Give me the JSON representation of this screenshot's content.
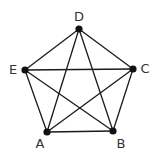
{
  "diagram": {
    "type": "complete-graph",
    "nodes": [
      {
        "id": "D",
        "label": "D",
        "x": 79,
        "y": 29,
        "lx": 79,
        "ly": 21
      },
      {
        "id": "C",
        "label": "C",
        "x": 133,
        "y": 69,
        "lx": 145,
        "ly": 73
      },
      {
        "id": "E",
        "label": "E",
        "x": 25,
        "y": 70,
        "lx": 13,
        "ly": 74
      },
      {
        "id": "A",
        "label": "A",
        "x": 47,
        "y": 132,
        "lx": 40,
        "ly": 148
      },
      {
        "id": "B",
        "label": "B",
        "x": 113,
        "y": 131,
        "lx": 121,
        "ly": 148
      }
    ],
    "edges": [
      [
        "D",
        "C"
      ],
      [
        "D",
        "E"
      ],
      [
        "D",
        "A"
      ],
      [
        "D",
        "B"
      ],
      [
        "C",
        "E"
      ],
      [
        "C",
        "A"
      ],
      [
        "C",
        "B"
      ],
      [
        "E",
        "A"
      ],
      [
        "E",
        "B"
      ],
      [
        "A",
        "B"
      ]
    ]
  }
}
